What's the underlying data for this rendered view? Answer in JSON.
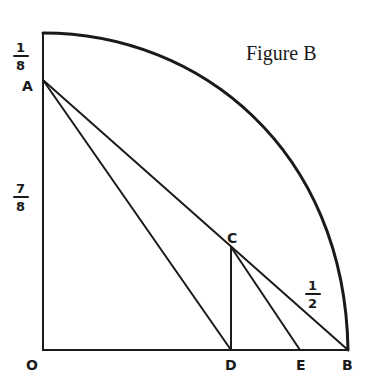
{
  "figure": {
    "title": "Figure B",
    "points": {
      "O": {
        "label": "O",
        "x": 43,
        "y": 350
      },
      "A": {
        "label": "A",
        "x": 43,
        "y": 80
      },
      "B": {
        "label": "B",
        "x": 348,
        "y": 350
      },
      "C": {
        "label": "C",
        "x": 231,
        "y": 247
      },
      "D": {
        "label": "D",
        "x": 231,
        "y": 350
      },
      "E": {
        "label": "E",
        "x": 300,
        "y": 350
      },
      "Top": {
        "x": 43,
        "y": 33
      }
    },
    "segment_labels": {
      "top_segment": {
        "num": "1",
        "den": "8"
      },
      "left_segment": {
        "num": "7",
        "den": "8"
      },
      "cb_segment": {
        "num": "1",
        "den": "2"
      }
    },
    "colors": {
      "ink": "#1a1a1a",
      "background": "#ffffff"
    }
  }
}
